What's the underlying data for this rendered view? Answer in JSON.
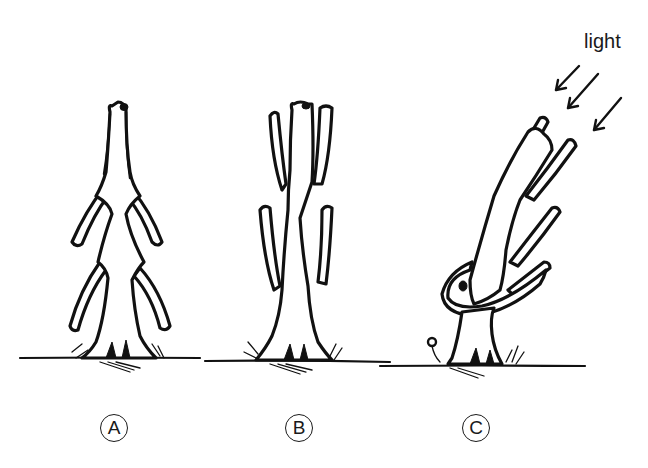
{
  "figure": {
    "light_label": "light",
    "panels": [
      {
        "id": "A",
        "label": "A",
        "description": "upright plant with two symmetric pairs of curved side branches"
      },
      {
        "id": "B",
        "label": "B",
        "description": "upright plant with branches growing parallel and close to the stem"
      },
      {
        "id": "C",
        "label": "C",
        "description": "plant bending toward incoming light from upper right"
      }
    ],
    "light_arrows": 3,
    "colors": {
      "ink": "#111111",
      "background": "#ffffff"
    }
  }
}
